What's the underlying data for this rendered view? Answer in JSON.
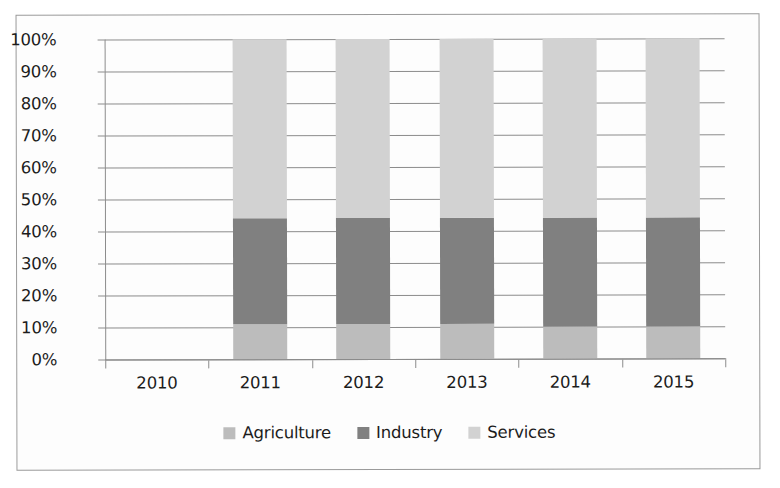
{
  "chart_data": {
    "type": "bar",
    "subtype": "100% stacked bar",
    "title": "",
    "xlabel": "",
    "ylabel": "",
    "categories": [
      "2010",
      "2011",
      "2012",
      "2013",
      "2014",
      "2015"
    ],
    "series": [
      {
        "name": "Agriculture",
        "color": "#bcbcbc",
        "values": [
          null,
          11,
          11,
          11,
          10,
          10
        ]
      },
      {
        "name": "Industry",
        "color": "#808080",
        "values": [
          null,
          33,
          33,
          33,
          34,
          34
        ]
      },
      {
        "name": "Services",
        "color": "#d2d2d2",
        "values": [
          null,
          56,
          56,
          56,
          56,
          56
        ]
      }
    ],
    "ylim": [
      0,
      100
    ],
    "y_ticks": [
      "0%",
      "10%",
      "20%",
      "30%",
      "40%",
      "50%",
      "60%",
      "70%",
      "80%",
      "90%",
      "100%"
    ],
    "y_tick_values": [
      0,
      10,
      20,
      30,
      40,
      50,
      60,
      70,
      80,
      90,
      100
    ],
    "grid": true,
    "legend_position": "bottom"
  },
  "legend": {
    "items": [
      {
        "label": "Agriculture",
        "color": "#bcbcbc"
      },
      {
        "label": "Industry",
        "color": "#808080"
      },
      {
        "label": "Services",
        "color": "#d2d2d2"
      }
    ]
  }
}
